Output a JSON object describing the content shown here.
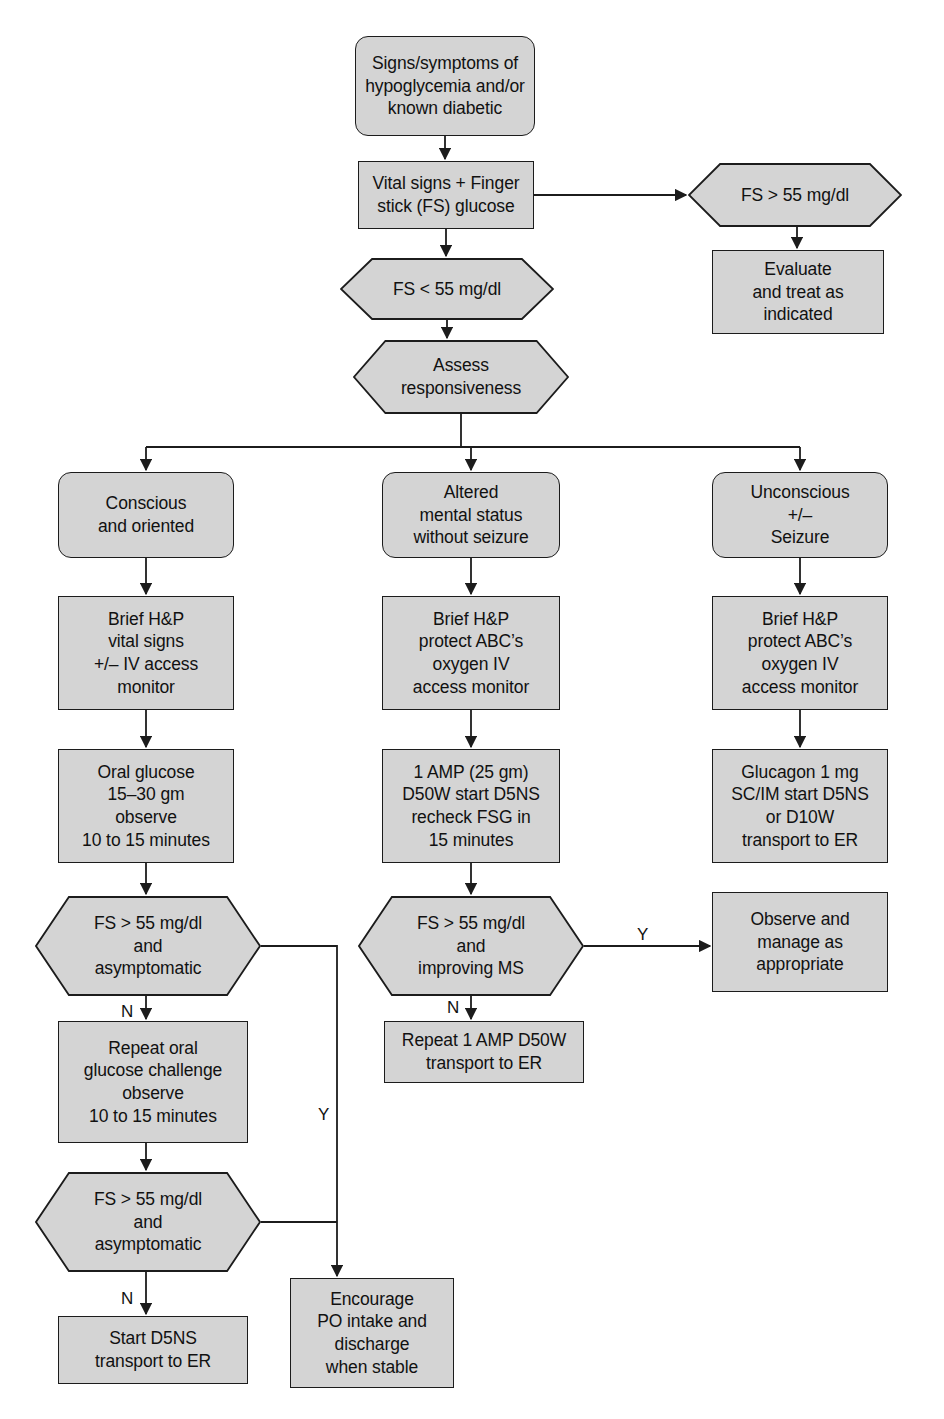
{
  "page": {
    "title_partial": "Hypoglycemia Algorithm",
    "width": 944,
    "height": 1419,
    "background": "#ffffff",
    "node_fill": "#d4d4d4",
    "node_stroke": "#1c1c1c",
    "text_color": "#111111"
  },
  "chart_data": {
    "type": "diagram",
    "diagram_kind": "clinical-decision-flowchart",
    "title": "Hypoglycemia Algorithm",
    "shapes_legend": {
      "terminal": "rounded rectangle",
      "process": "rectangle",
      "decision": "hexagon"
    },
    "nodes": [
      {
        "id": "n1",
        "shape": "terminal",
        "text": "Signs/symptoms of\nhypoglycemia and/or\nknown diabetic",
        "x": 355,
        "y": 36,
        "w": 180,
        "h": 100
      },
      {
        "id": "n2",
        "shape": "process",
        "text": "Vital signs + Finger\nstick (FS) glucose",
        "x": 358,
        "y": 161,
        "w": 176,
        "h": 68
      },
      {
        "id": "n3",
        "shape": "decision",
        "text": "FS > 55 mg/dl",
        "x": 688,
        "y": 163,
        "w": 214,
        "h": 64
      },
      {
        "id": "n4",
        "shape": "process",
        "text": "Evaluate\nand treat as\nindicated",
        "x": 712,
        "y": 250,
        "w": 172,
        "h": 84
      },
      {
        "id": "n5",
        "shape": "decision",
        "text": "FS < 55 mg/dl",
        "x": 340,
        "y": 258,
        "w": 214,
        "h": 62
      },
      {
        "id": "n6",
        "shape": "decision",
        "text": "Assess\nresponsiveness",
        "x": 353,
        "y": 340,
        "w": 216,
        "h": 74
      },
      {
        "id": "n7",
        "shape": "terminal",
        "text": "Conscious\nand oriented",
        "x": 58,
        "y": 472,
        "w": 176,
        "h": 86
      },
      {
        "id": "n8",
        "shape": "terminal",
        "text": "Altered\nmental status\nwithout seizure",
        "x": 382,
        "y": 472,
        "w": 178,
        "h": 86
      },
      {
        "id": "n9",
        "shape": "terminal",
        "text": "Unconscious\n+/–\nSeizure",
        "x": 712,
        "y": 472,
        "w": 176,
        "h": 86
      },
      {
        "id": "n10",
        "shape": "process",
        "text": "Brief H&P\nvital signs\n+/– IV access\nmonitor",
        "x": 58,
        "y": 596,
        "w": 176,
        "h": 114
      },
      {
        "id": "n11",
        "shape": "process",
        "text": "Brief H&P\nprotect ABC’s\noxygen IV\naccess monitor",
        "x": 382,
        "y": 596,
        "w": 178,
        "h": 114
      },
      {
        "id": "n12",
        "shape": "process",
        "text": "Brief H&P\nprotect ABC’s\noxygen IV\naccess monitor",
        "x": 712,
        "y": 596,
        "w": 176,
        "h": 114
      },
      {
        "id": "n13",
        "shape": "process",
        "text": "Oral glucose\n15–30 gm\nobserve\n10 to 15 minutes",
        "x": 58,
        "y": 749,
        "w": 176,
        "h": 114
      },
      {
        "id": "n14",
        "shape": "process",
        "text": "1 AMP (25 gm)\nD50W start D5NS\nrecheck FSG in\n15 minutes",
        "x": 382,
        "y": 749,
        "w": 178,
        "h": 114
      },
      {
        "id": "n15",
        "shape": "process",
        "text": "Glucagon 1 mg\nSC/IM start D5NS\nor D10W\ntransport to ER",
        "x": 712,
        "y": 749,
        "w": 176,
        "h": 114
      },
      {
        "id": "n16",
        "shape": "decision",
        "text": "FS > 55 mg/dl\nand\nasymptomatic",
        "x": 35,
        "y": 896,
        "w": 226,
        "h": 100
      },
      {
        "id": "n17",
        "shape": "decision",
        "text": "FS > 55 mg/dl\nand\nimproving MS",
        "x": 358,
        "y": 896,
        "w": 226,
        "h": 100
      },
      {
        "id": "n18",
        "shape": "process",
        "text": "Observe and\nmanage as\nappropriate",
        "x": 712,
        "y": 892,
        "w": 176,
        "h": 100
      },
      {
        "id": "n19",
        "shape": "process",
        "text": "Repeat 1 AMP D50W\ntransport to ER",
        "x": 384,
        "y": 1021,
        "w": 200,
        "h": 62
      },
      {
        "id": "n20",
        "shape": "process",
        "text": "Repeat oral\nglucose challenge\nobserve\n10 to 15 minutes",
        "x": 58,
        "y": 1021,
        "w": 190,
        "h": 122
      },
      {
        "id": "n21",
        "shape": "decision",
        "text": "FS > 55 mg/dl\nand\nasymptomatic",
        "x": 35,
        "y": 1172,
        "w": 226,
        "h": 100
      },
      {
        "id": "n22",
        "shape": "process",
        "text": "Start D5NS\ntransport to ER",
        "x": 58,
        "y": 1316,
        "w": 190,
        "h": 68
      },
      {
        "id": "n23",
        "shape": "process",
        "text": "Encourage\nPO intake and\ndischarge\nwhen stable",
        "x": 290,
        "y": 1278,
        "w": 164,
        "h": 110
      }
    ],
    "edges": [
      {
        "from": "n1",
        "to": "n2",
        "label": ""
      },
      {
        "from": "n2",
        "to": "n3",
        "label": ""
      },
      {
        "from": "n3",
        "to": "n4",
        "label": ""
      },
      {
        "from": "n2",
        "to": "n5",
        "label": ""
      },
      {
        "from": "n5",
        "to": "n6",
        "label": ""
      },
      {
        "from": "n6",
        "to": "n7",
        "label": ""
      },
      {
        "from": "n6",
        "to": "n8",
        "label": ""
      },
      {
        "from": "n6",
        "to": "n9",
        "label": ""
      },
      {
        "from": "n7",
        "to": "n10",
        "label": ""
      },
      {
        "from": "n8",
        "to": "n11",
        "label": ""
      },
      {
        "from": "n9",
        "to": "n12",
        "label": ""
      },
      {
        "from": "n10",
        "to": "n13",
        "label": ""
      },
      {
        "from": "n11",
        "to": "n14",
        "label": ""
      },
      {
        "from": "n12",
        "to": "n15",
        "label": ""
      },
      {
        "from": "n13",
        "to": "n16",
        "label": ""
      },
      {
        "from": "n14",
        "to": "n17",
        "label": ""
      },
      {
        "from": "n17",
        "to": "n18",
        "label": "Y"
      },
      {
        "from": "n17",
        "to": "n19",
        "label": "N"
      },
      {
        "from": "n16",
        "to": "n20",
        "label": "N"
      },
      {
        "from": "n16",
        "to": "n23",
        "label": "Y"
      },
      {
        "from": "n20",
        "to": "n21",
        "label": ""
      },
      {
        "from": "n21",
        "to": "n22",
        "label": "N"
      },
      {
        "from": "n21",
        "to": "n23",
        "label": ""
      }
    ],
    "edge_labels": [
      {
        "text": "Y",
        "x": 637,
        "y": 926
      },
      {
        "text": "N",
        "x": 447,
        "y": 999
      },
      {
        "text": "N",
        "x": 121,
        "y": 1003
      },
      {
        "text": "Y",
        "x": 318,
        "y": 1106
      },
      {
        "text": "N",
        "x": 121,
        "y": 1290
      }
    ]
  }
}
